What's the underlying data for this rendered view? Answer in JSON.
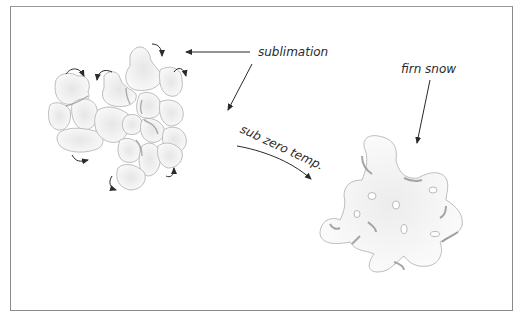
{
  "diagram": {
    "labels": {
      "sublimation": "sublimation",
      "sub_zero_temp": "sub zero temp.",
      "firn_snow": "firn snow"
    },
    "elements": {
      "left_cluster": "cluster of fresh snow grains with curved sublimation arrows",
      "right_grain": "single consolidated firn snow grain",
      "arrows": [
        "sublimation-to-cluster",
        "sublimation-down",
        "sub-zero-temp-curve",
        "firn-snow-pointer"
      ]
    },
    "colors": {
      "grain_fill": "#efefef",
      "grain_edge": "#b8b8b8",
      "grain_shadow": "#8c8c8c",
      "text": "#2a2a2a",
      "arrow": "#2a2a2a",
      "frame": "#8a8a8a"
    }
  }
}
